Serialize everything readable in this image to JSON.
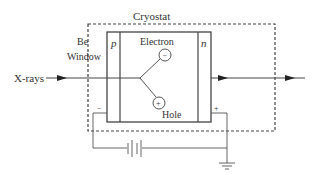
{
  "diagram": {
    "title": "Cryostat",
    "labels": {
      "cryostat": "Cryostat",
      "be_line1": "Be",
      "be_line2": "Window",
      "xrays": "X-rays",
      "p": "p",
      "n": "n",
      "electron": "Electron",
      "hole": "Hole",
      "electron_sign": "−",
      "hole_sign": "+",
      "minus_terminal": "−",
      "plus_terminal": "+"
    },
    "colors": {
      "line": "#444444",
      "text": "#333333",
      "background": "#ffffff"
    }
  }
}
